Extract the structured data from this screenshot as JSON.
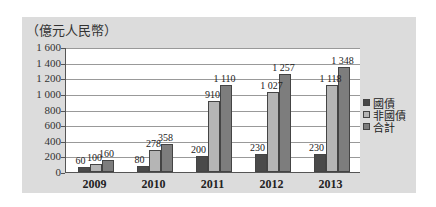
{
  "chart_data": {
    "type": "bar",
    "title": "",
    "ylabel": "（億元人民幣）",
    "xlabel": "",
    "ylim": [
      0,
      1600
    ],
    "yticks": [
      "0",
      "200",
      "400",
      "600",
      "800",
      "1 000",
      "1 200",
      "1 400",
      "1 600"
    ],
    "categories": [
      "2009",
      "2010",
      "2011",
      "2012",
      "2013"
    ],
    "series": [
      {
        "name": "國債",
        "values": [
          60,
          80,
          200,
          230,
          230
        ],
        "labels": [
          "60",
          "80",
          "200",
          "230",
          "230"
        ],
        "color": "#4a4a4a"
      },
      {
        "name": "非國債",
        "values": [
          100,
          278,
          910,
          1027,
          1118
        ],
        "labels": [
          "100",
          "278",
          "910",
          "1 027",
          "1 118"
        ],
        "color": "#b5b5b5"
      },
      {
        "name": "合計",
        "values": [
          160,
          358,
          1110,
          1257,
          1348
        ],
        "labels": [
          "160",
          "358",
          "1 110",
          "1 257",
          "1 348"
        ],
        "color": "#7d7d7d"
      }
    ],
    "grid": true,
    "legend_position": "right"
  }
}
